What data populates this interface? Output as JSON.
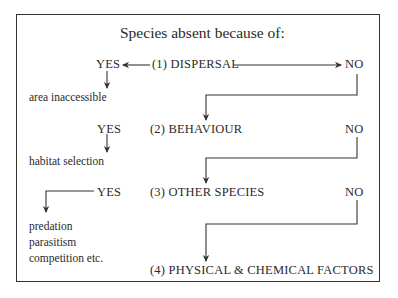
{
  "title": "Species absent because of:",
  "factors": [
    {
      "label": "(1) DISPERSAL",
      "yes": "YES",
      "no": "NO",
      "yes_outcome": [
        "area inaccessible"
      ]
    },
    {
      "label": "(2) BEHAVIOUR",
      "yes": "YES",
      "no": "NO",
      "yes_outcome": [
        "habitat selection"
      ]
    },
    {
      "label": "(3) OTHER SPECIES",
      "yes": "YES",
      "no": "NO",
      "yes_outcome": [
        "predation",
        "parasitism",
        "competition etc."
      ]
    },
    {
      "label": "(4) PHYSICAL & CHEMICAL FACTORS"
    }
  ],
  "colors": {
    "line": "#333333",
    "text": "#2a2a2a"
  }
}
